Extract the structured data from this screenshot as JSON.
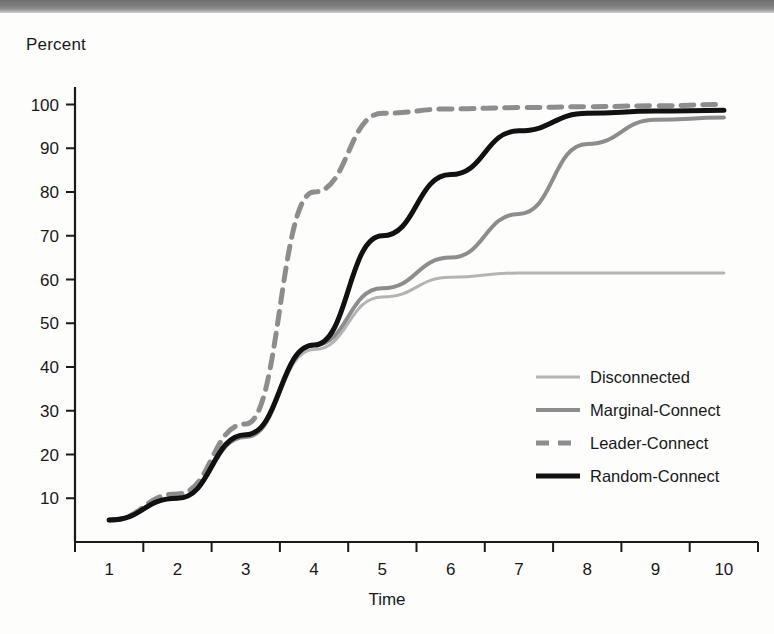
{
  "chart_data": {
    "type": "line",
    "title": "",
    "xlabel": "Time",
    "ylabel": "Percent",
    "x": [
      1,
      2,
      3,
      4,
      5,
      6,
      7,
      8,
      9,
      10
    ],
    "categories": [
      "1",
      "2",
      "3",
      "4",
      "5",
      "6",
      "7",
      "8",
      "9",
      "10"
    ],
    "xlim": [
      0.5,
      10.5
    ],
    "ylim": [
      0,
      104
    ],
    "yticks": [
      10,
      20,
      30,
      40,
      50,
      60,
      70,
      80,
      90,
      100
    ],
    "ytick_labels": [
      "10",
      "20",
      "30",
      "40",
      "50",
      "60",
      "70",
      "80",
      "90",
      "100"
    ],
    "grid": false,
    "legend_position": "center-right-inside",
    "series": [
      {
        "name": "Disconnected",
        "color": "#b4b4b4",
        "style": "solid-thin",
        "width": 3,
        "values": [
          5,
          10,
          24,
          44,
          56,
          60.5,
          61.5,
          61.5,
          61.5,
          61.5
        ]
      },
      {
        "name": "Marginal-Connect",
        "color": "#8d8d8d",
        "style": "solid-thick",
        "width": 4,
        "values": [
          5,
          10,
          24,
          45,
          58,
          65,
          75,
          91,
          96.5,
          97
        ]
      },
      {
        "name": "Leader-Connect",
        "color": "#8d8d8d",
        "style": "dashed",
        "width": 5,
        "values": [
          5,
          11,
          27,
          80,
          98,
          99,
          99.3,
          99.5,
          99.7,
          100
        ]
      },
      {
        "name": "Random-Connect",
        "color": "#111111",
        "style": "solid-thick",
        "width": 5,
        "values": [
          5,
          10,
          24.5,
          45,
          70,
          84,
          94,
          98,
          98.5,
          98.7
        ]
      }
    ]
  },
  "axes": {
    "y_title": "Percent",
    "x_title": "Time"
  },
  "legend": {
    "items": [
      {
        "label": "Disconnected"
      },
      {
        "label": "Marginal-Connect"
      },
      {
        "label": "Leader-Connect"
      },
      {
        "label": "Random-Connect"
      }
    ]
  }
}
